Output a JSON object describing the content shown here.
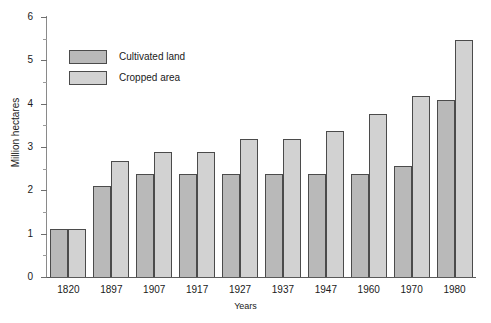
{
  "chart_data": {
    "type": "bar",
    "title": "",
    "subtitle": "",
    "xlabel": "Years",
    "ylabel": "Million hectares",
    "categories": [
      "1820",
      "1897",
      "1907",
      "1917",
      "1927",
      "1937",
      "1947",
      "1960",
      "1970",
      "1980"
    ],
    "series": [
      {
        "name": "Cultivated land",
        "color": "#b9b9b9",
        "values": [
          1.1,
          2.1,
          2.38,
          2.38,
          2.38,
          2.38,
          2.38,
          2.38,
          2.57,
          4.08
        ]
      },
      {
        "name": "Cropped area",
        "color": "#d2d2d2",
        "values": [
          1.1,
          2.67,
          2.88,
          2.88,
          3.18,
          3.18,
          3.38,
          3.77,
          4.17,
          5.47
        ]
      }
    ],
    "ylim": [
      0,
      6
    ],
    "y_major_ticks": [
      "0",
      "1",
      "2",
      "3",
      "4",
      "5",
      "6"
    ],
    "y_minor_ticks": [
      0.5,
      1.5,
      2.5,
      3.5,
      4.5,
      5.5
    ],
    "grid": false,
    "legend_position": "top-left",
    "bar_border_color": "#4b4b4b",
    "axis_color": "#5a5a5a"
  },
  "legend": {
    "items": [
      {
        "label": "Cultivated land",
        "swatch": "cultivated"
      },
      {
        "label": "Cropped area",
        "swatch": "cropped"
      }
    ]
  }
}
